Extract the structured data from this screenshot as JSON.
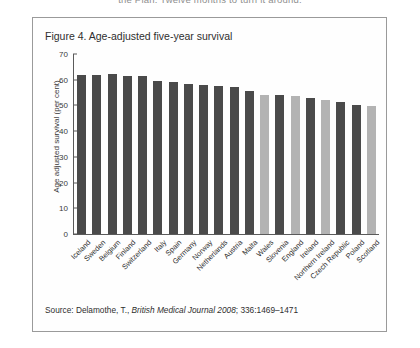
{
  "page": {
    "running_header": "the Plan. Twelve months to turn it around."
  },
  "figure": {
    "title": "Figure 4. Age-adjusted five-year survival",
    "source_prefix": "Source: Delamothe, T., ",
    "source_italic": "British Medical Journal 2008",
    "source_suffix": "; 336:1469–1471"
  },
  "chart_data": {
    "type": "bar",
    "title": "Figure 4. Age-adjusted five-year survival",
    "xlabel": "",
    "ylabel": "Age adjusted survival (per cent)",
    "ylim": [
      0,
      70
    ],
    "yticks": [
      0,
      10,
      20,
      30,
      40,
      50,
      60,
      70
    ],
    "grid": false,
    "legend": "none",
    "colors": {
      "other": "#4a4a4a",
      "uk_nation": "#b3b3b3"
    },
    "categories": [
      "Iceland",
      "Sweden",
      "Belgium",
      "Finland",
      "Switzerland",
      "Italy",
      "Spain",
      "Germany",
      "Norway",
      "Netherlands",
      "Austria",
      "Malta",
      "Wales",
      "Slovenia",
      "England",
      "Ireland",
      "Northern Ireland",
      "Czech Republic",
      "Poland",
      "Scotland"
    ],
    "values": [
      61.8,
      61.7,
      62.2,
      61.5,
      61.3,
      59.7,
      59.0,
      58.4,
      58.0,
      57.6,
      57.0,
      55.8,
      54.2,
      54.2,
      53.6,
      53.0,
      52.2,
      51.3,
      50.3,
      49.8
    ],
    "bar_styles": [
      "other",
      "other",
      "other",
      "other",
      "other",
      "other",
      "other",
      "other",
      "other",
      "other",
      "other",
      "other",
      "uk_nation",
      "other",
      "uk_nation",
      "other",
      "uk_nation",
      "other",
      "other",
      "uk_nation"
    ]
  }
}
